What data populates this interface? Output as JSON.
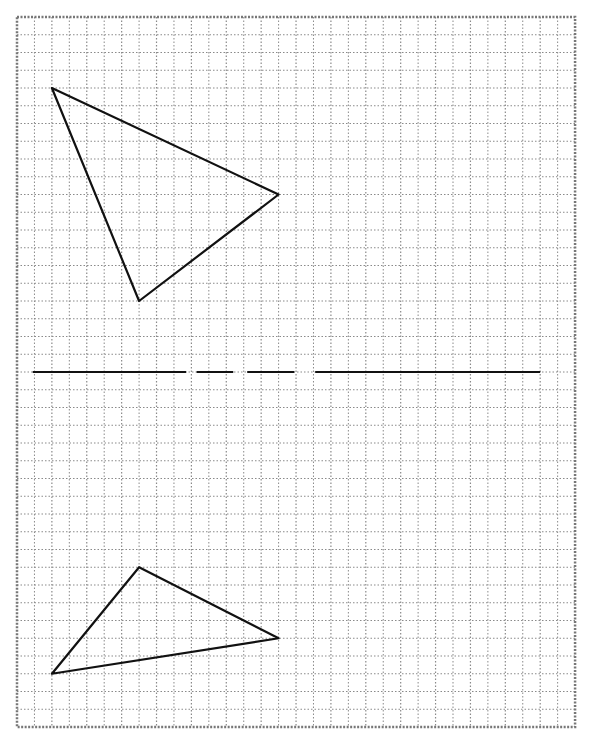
{
  "diagram": {
    "type": "grid-geometry",
    "grid": {
      "columns": 32,
      "rows": 40,
      "origin_px": [
        17,
        17
      ],
      "cell_w_px": 17.44,
      "cell_h_px": 17.75,
      "line_color": "#8a8a8a",
      "border_color": "#777777",
      "line_style": "dotted"
    },
    "shapes": [
      {
        "name": "upper-triangle",
        "kind": "triangle",
        "vertices_grid": [
          [
            2,
            4
          ],
          [
            15,
            10
          ],
          [
            7,
            16
          ]
        ],
        "stroke": "#111111",
        "stroke_width": 2.2
      },
      {
        "name": "lower-triangle",
        "kind": "triangle",
        "vertices_grid": [
          [
            7,
            31
          ],
          [
            15,
            35
          ],
          [
            2,
            37
          ]
        ],
        "stroke": "#111111",
        "stroke_width": 2.2
      }
    ],
    "dividing_line": {
      "name": "mirror-line",
      "row": 20,
      "segments_grid_x": [
        [
          0.9,
          9.7
        ],
        [
          10.3,
          12.4
        ],
        [
          13.2,
          15.9
        ],
        [
          17.1,
          30.0
        ]
      ],
      "stroke": "#111111",
      "stroke_width": 2.2
    }
  }
}
